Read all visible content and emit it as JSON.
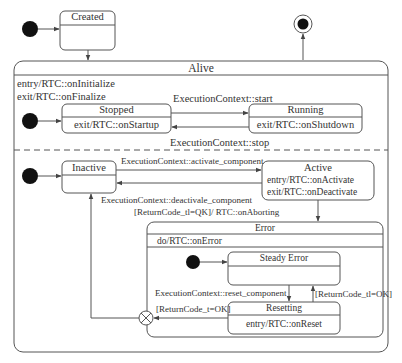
{
  "diagram": {
    "type": "UML state machine",
    "states": {
      "created": {
        "name": "Created"
      },
      "alive": {
        "name": "Alive",
        "entry": "entry/RTC::onInitialize",
        "exit": "exit/RTC::onFinalize"
      },
      "stopped": {
        "name": "Stopped",
        "action": "exit/RTC::onStartup"
      },
      "running": {
        "name": "Running",
        "action": "exit/RTC::onShutdown"
      },
      "inactive": {
        "name": "Inactive"
      },
      "active": {
        "name": "Active",
        "entry": "entry/RTC::onActivate",
        "exit": "exit/RTC::onDeactivate"
      },
      "error": {
        "name": "Error",
        "action": "do/RTC::onError"
      },
      "steady_error": {
        "name": "Steady Error"
      },
      "resetting": {
        "name": "Resetting",
        "action": "entry/RTC::onReset"
      }
    },
    "transitions": {
      "start": "ExecutionContext::start",
      "stop": "ExecutionContext::stop",
      "activate": "ExecutionContext::activate_component",
      "deactivate": "ExecutionContext::deactivale_component",
      "aborting": "[ReturnCode_tl=QK]/ RTC::onAborting",
      "reset": "ExecutionContext::reset_component",
      "reset_fail": "[ReturnCode_tl=OK]",
      "reset_ok": "[ReturnCode_t=OK]"
    },
    "colors": {
      "line": "#555555",
      "fill": "#ffffff",
      "pseudostate": "#111111"
    }
  }
}
